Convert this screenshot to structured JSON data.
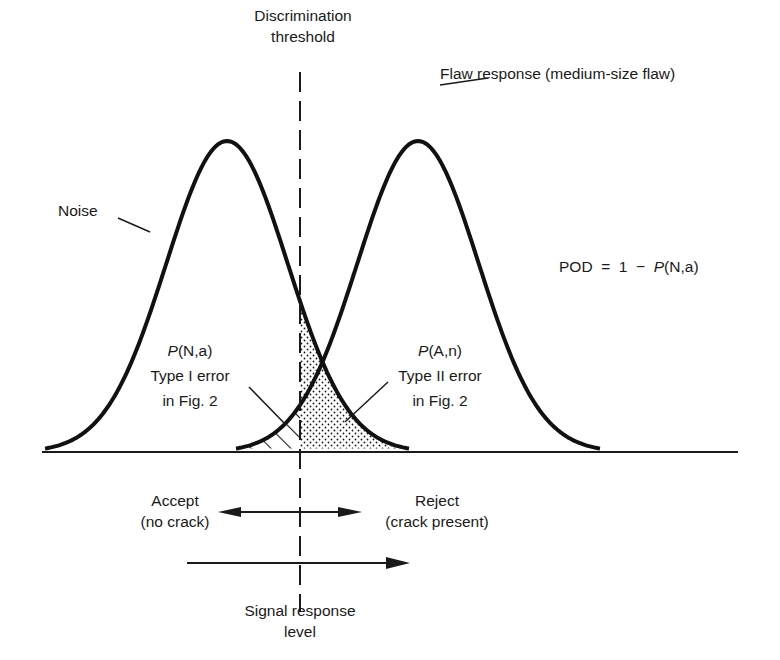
{
  "diagram": {
    "title_threshold": {
      "line1": "Discrimination",
      "line2": "threshold"
    },
    "flaw_label": "Flaw response (medium-size flaw)",
    "noise_label": "Noise",
    "pod_formula": {
      "lhs": "POD  =  1  −  ",
      "p": "P",
      "args": "(N,a)"
    },
    "type1": {
      "p": "P",
      "args": "(N,a)",
      "line2": "Type I  error",
      "line3": "in Fig. 2"
    },
    "type2": {
      "p": "P",
      "args": "(A,n)",
      "line2": "Type II  error",
      "line3": "in Fig. 2"
    },
    "accept": {
      "line1": "Accept",
      "line2": "(no crack)"
    },
    "reject": {
      "line1": "Reject",
      "line2": "(crack present)"
    },
    "x_axis_label": {
      "line1": "Signal response",
      "line2": "level"
    },
    "colors": {
      "ink": "#1a1a1a",
      "background": "#ffffff"
    }
  },
  "chart_data": {
    "type": "line",
    "xlabel": "Signal response level",
    "ylabel": "",
    "series": [
      {
        "name": "Noise",
        "shape": "bell",
        "center_px": 227,
        "half_width_px": 182,
        "peak_y_px": 141
      },
      {
        "name": "Flaw response (medium-size flaw)",
        "shape": "bell",
        "center_px": 418,
        "half_width_px": 182,
        "peak_y_px": 141
      }
    ],
    "threshold": {
      "name": "Discrimination threshold",
      "x_px": 300,
      "style": "dashed"
    },
    "regions": [
      {
        "name": "P(N,a) Type I error",
        "fill": "hatched",
        "side": "left of threshold, under flaw curve"
      },
      {
        "name": "P(A,n) Type II error",
        "fill": "dotted",
        "side": "right of threshold, under noise curve"
      }
    ],
    "annotations": [
      "POD = 1 − P(N,a)",
      "Accept (no crack)",
      "Reject (crack present)"
    ],
    "grid": false
  }
}
